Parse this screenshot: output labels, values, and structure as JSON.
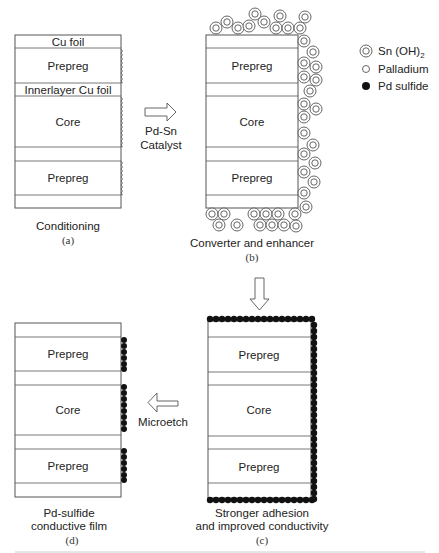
{
  "figure": {
    "panels": {
      "a": {
        "letter": "(a)",
        "caption": "Conditioning",
        "layers": [
          "Cu foil",
          "Prepreg",
          "Innerlayer Cu foil",
          "Core",
          "",
          "Prepreg",
          ""
        ]
      },
      "b": {
        "letter": "(b)",
        "caption": "Converter and enhancer",
        "layers": [
          "",
          "Prepreg",
          "",
          "Core",
          "",
          "Prepreg",
          ""
        ]
      },
      "c": {
        "letter": "(c)",
        "caption_line1": "Stronger adhesion",
        "caption_line2": "and improved conductivity",
        "layers": [
          "",
          "Prepreg",
          "",
          "Core",
          "",
          "Prepreg",
          ""
        ]
      },
      "d": {
        "letter": "(d)",
        "caption_line1": "Pd-sulfide",
        "caption_line2": "conductive film",
        "layers": [
          "",
          "Prepreg",
          "",
          "Core",
          "",
          "Prepreg",
          ""
        ]
      }
    },
    "arrows": {
      "a_to_b": {
        "label_line1": "Pd-Sn",
        "label_line2": "Catalyst",
        "direction": "right"
      },
      "b_to_c": {
        "label": "",
        "direction": "down"
      },
      "c_to_d": {
        "label": "Microetch",
        "direction": "left"
      }
    },
    "legend": {
      "items": [
        {
          "symbol": "double-circle",
          "label": "Sn (OH)",
          "subscript": "2"
        },
        {
          "symbol": "open-circle",
          "label": "Palladium"
        },
        {
          "symbol": "filled-circle",
          "label": "Pd sulfide"
        }
      ]
    },
    "colors": {
      "line": "#555555",
      "dot": "#111111",
      "background": "#ffffff"
    }
  }
}
